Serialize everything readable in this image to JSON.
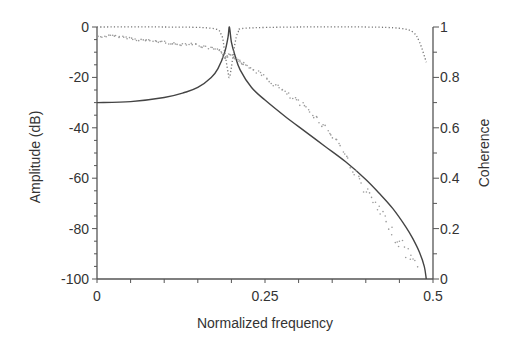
{
  "chart_data": {
    "type": "line",
    "title": "",
    "xlabel": "Normalized frequency",
    "ylabel": "Amplitude (dB)",
    "ylabel_right": "Coherence",
    "xlim": [
      0,
      0.5
    ],
    "ylim": [
      -100,
      0
    ],
    "ylim_right": [
      0,
      1
    ],
    "grid": false,
    "x_ticks": [
      0,
      0.25,
      0.5
    ],
    "x_tick_labels": [
      "0",
      "0.25",
      "0.5"
    ],
    "y_ticks": [
      0,
      -20,
      -40,
      -60,
      -80,
      -100
    ],
    "y_tick_labels": [
      "0",
      "-20",
      "-40",
      "-60",
      "-80",
      "-100"
    ],
    "y_right_ticks": [
      1,
      0.8,
      0.6,
      0.4,
      0.2,
      0
    ],
    "y_right_tick_labels": [
      "1",
      "0.8",
      "0.6",
      "0.4",
      "0.2",
      "0"
    ],
    "series": [
      {
        "name": "Theoretical amplitude",
        "style": "solid",
        "axis": "left",
        "x": [
          0,
          0.05,
          0.1,
          0.13,
          0.15,
          0.17,
          0.18,
          0.19,
          0.195,
          0.197,
          0.2,
          0.205,
          0.213,
          0.23,
          0.25,
          0.28,
          0.31,
          0.34,
          0.37,
          0.4,
          0.42,
          0.44,
          0.46,
          0.47,
          0.48,
          0.487,
          0.49
        ],
        "values": [
          -30,
          -29.6,
          -28,
          -26,
          -24,
          -20,
          -16.5,
          -10,
          -4,
          0,
          -6,
          -11,
          -17,
          -24,
          -29,
          -35.5,
          -41.5,
          -47.5,
          -53.5,
          -60.5,
          -66,
          -72,
          -79.5,
          -84,
          -89.5,
          -95,
          -100
        ]
      },
      {
        "name": "Measured amplitude",
        "style": "scatter-dots",
        "axis": "left",
        "x": [
          0.0,
          0.02,
          0.04,
          0.06,
          0.08,
          0.1,
          0.12,
          0.14,
          0.16,
          0.18,
          0.19,
          0.2,
          0.21,
          0.22,
          0.24,
          0.26,
          0.28,
          0.3,
          0.32,
          0.34,
          0.36,
          0.38,
          0.4,
          0.42,
          0.44,
          0.46,
          0.48
        ],
        "values": [
          -4,
          -3.5,
          -4,
          -5,
          -5.5,
          -6,
          -7,
          -6.5,
          -8,
          -9,
          -12,
          -11,
          -13,
          -15,
          -18,
          -22,
          -26,
          -30,
          -34,
          -40,
          -46,
          -56,
          -65,
          -73,
          -82,
          -89,
          -96
        ]
      },
      {
        "name": "Coherence",
        "style": "dotted",
        "axis": "right",
        "x": [
          0,
          0.1,
          0.17,
          0.185,
          0.19,
          0.195,
          0.197,
          0.2,
          0.205,
          0.21,
          0.22,
          0.3,
          0.4,
          0.45,
          0.47,
          0.48,
          0.49
        ],
        "values": [
          1.0,
          1.0,
          0.995,
          0.97,
          0.9,
          0.82,
          0.8,
          0.84,
          0.93,
          0.98,
          0.995,
          1.0,
          1.0,
          0.995,
          0.98,
          0.94,
          0.86
        ]
      }
    ]
  }
}
